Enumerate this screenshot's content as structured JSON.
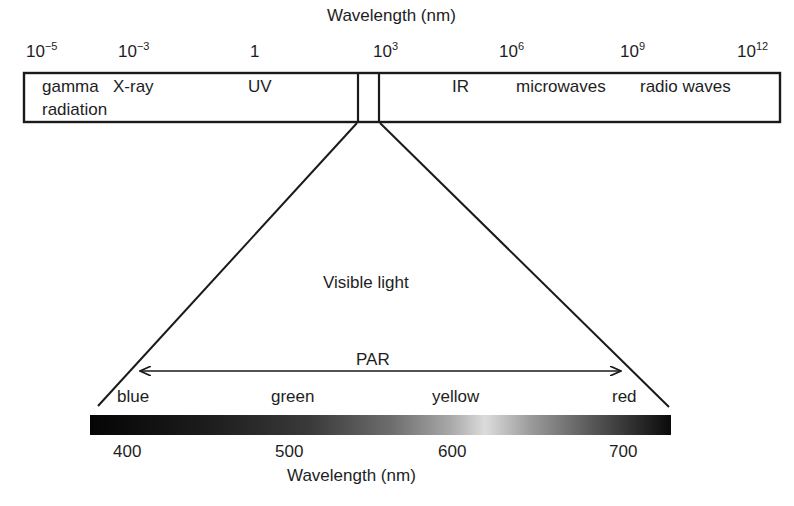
{
  "top_axis": {
    "title": "Wavelength (nm)",
    "ticks": [
      {
        "base": "10",
        "exp": "−5"
      },
      {
        "base": "10",
        "exp": "−3"
      },
      {
        "base": "1",
        "exp": ""
      },
      {
        "base": "10",
        "exp": "3"
      },
      {
        "base": "10",
        "exp": "6"
      },
      {
        "base": "10",
        "exp": "9"
      },
      {
        "base": "10",
        "exp": "12"
      }
    ]
  },
  "spectrum_bands": {
    "gamma_line1": "gamma",
    "gamma_line2": "radiation",
    "xray": "X-ray",
    "uv": "UV",
    "ir": "IR",
    "microwaves": "microwaves",
    "radio": "radio waves"
  },
  "visible": {
    "label": "Visible light",
    "par_label": "PAR",
    "colors": [
      "blue",
      "green",
      "yellow",
      "red"
    ]
  },
  "bottom_axis": {
    "title": "Wavelength (nm)",
    "ticks": [
      "400",
      "500",
      "600",
      "700"
    ]
  },
  "style": {
    "line_color": "#1a1a1a",
    "gradient_stops": [
      "#050505",
      "#2a2a2a",
      "#777777",
      "#d8d8d8",
      "#777777",
      "#0a0a0a"
    ]
  }
}
